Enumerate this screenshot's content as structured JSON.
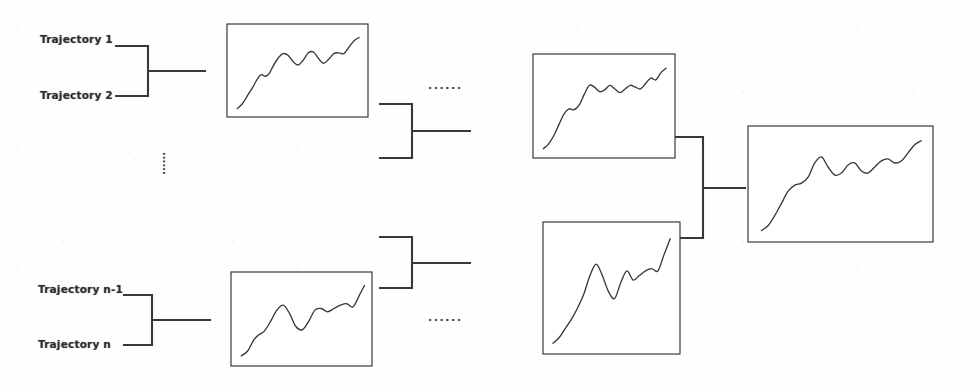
{
  "figure": {
    "background_color": "#fefefe",
    "stroke_color": "#39393b",
    "label_color": "#2e2e30",
    "width": 980,
    "height": 386
  },
  "labels": {
    "trajectory_1": "Trajectory 1",
    "trajectory_2": "Trajectory 2",
    "trajectory_n_minus_1": "Trajectory n-1",
    "trajectory_n": "Trajectory  n"
  },
  "ellipses": {
    "vertical_between_groups": "......",
    "horizontal_top": "......",
    "horizontal_bottom": "......"
  },
  "brackets": [
    {
      "name": "merge-bracket-level1-top",
      "x_left": 120,
      "x_mid": 148,
      "x_right": 205,
      "y_top": 46,
      "y_bottom": 96,
      "y_out": 71
    },
    {
      "name": "merge-bracket-level1-bottom",
      "x_left": 124,
      "x_mid": 152,
      "x_right": 210,
      "y_top": 295,
      "y_bottom": 345,
      "y_out": 320
    },
    {
      "name": "merge-bracket-level2-top",
      "x_left": 380,
      "x_mid": 412,
      "x_right": 470,
      "y_top": 104,
      "y_bottom": 158,
      "y_out": 131
    },
    {
      "name": "merge-bracket-level2-bottom",
      "x_left": 380,
      "x_mid": 412,
      "x_right": 470,
      "y_top": 237,
      "y_bottom": 288,
      "y_out": 263
    },
    {
      "name": "merge-bracket-level3-final",
      "x_left": 672,
      "x_mid": 703,
      "x_right": 745,
      "y_top": 137,
      "y_bottom": 238,
      "y_out": 188
    }
  ],
  "chart_data": [
    {
      "name": "trajectory-chart-group-1",
      "type": "line",
      "title": "",
      "xlabel": "",
      "ylabel": "",
      "grid": false,
      "legend": null,
      "box": {
        "x": 227,
        "y": 24,
        "width": 141,
        "height": 93
      },
      "xlim": [
        0,
        100
      ],
      "ylim": [
        0,
        100
      ],
      "x": [
        2,
        6,
        10,
        14,
        18,
        21,
        24,
        27,
        30,
        34,
        38,
        42,
        46,
        50,
        54,
        58,
        62,
        66,
        70,
        74,
        78,
        82,
        86,
        90,
        94,
        98
      ],
      "y": [
        4,
        10,
        20,
        30,
        41,
        46,
        44,
        47,
        56,
        66,
        72,
        70,
        62,
        58,
        64,
        73,
        74,
        66,
        60,
        65,
        72,
        73,
        72,
        80,
        88,
        92
      ]
    },
    {
      "name": "trajectory-chart-group-n",
      "type": "line",
      "title": "",
      "xlabel": "",
      "ylabel": "",
      "grid": false,
      "legend": null,
      "box": {
        "x": 231,
        "y": 272,
        "width": 141,
        "height": 94
      },
      "xlim": [
        0,
        100
      ],
      "ylim": [
        0,
        100
      ],
      "x": [
        2,
        7,
        12,
        16,
        20,
        25,
        30,
        35,
        40,
        45,
        50,
        55,
        60,
        65,
        70,
        75,
        80,
        85,
        90,
        95,
        99
      ],
      "y": [
        6,
        12,
        26,
        32,
        36,
        48,
        62,
        68,
        58,
        42,
        38,
        48,
        62,
        64,
        60,
        64,
        68,
        70,
        66,
        80,
        92
      ]
    },
    {
      "name": "merged-chart-top",
      "type": "line",
      "title": "",
      "xlabel": "",
      "ylabel": "",
      "grid": false,
      "legend": null,
      "box": {
        "x": 533,
        "y": 54,
        "width": 142,
        "height": 104
      },
      "xlim": [
        0,
        100
      ],
      "ylim": [
        0,
        100
      ],
      "x": [
        2,
        6,
        10,
        14,
        18,
        22,
        26,
        30,
        34,
        38,
        42,
        46,
        50,
        54,
        58,
        62,
        66,
        70,
        74,
        78,
        82,
        86,
        90,
        94,
        98
      ],
      "y": [
        4,
        9,
        18,
        30,
        42,
        48,
        47,
        52,
        64,
        74,
        72,
        67,
        69,
        74,
        70,
        66,
        70,
        74,
        72,
        70,
        76,
        82,
        80,
        88,
        93
      ]
    },
    {
      "name": "merged-chart-bottom",
      "type": "line",
      "title": "",
      "xlabel": "",
      "ylabel": "",
      "grid": false,
      "legend": null,
      "box": {
        "x": 543,
        "y": 222,
        "width": 137,
        "height": 132
      },
      "xlim": [
        0,
        100
      ],
      "ylim": [
        0,
        100
      ],
      "x": [
        2,
        7,
        12,
        17,
        22,
        27,
        32,
        37,
        42,
        47,
        52,
        57,
        62,
        67,
        72,
        77,
        82,
        87,
        92,
        97
      ],
      "y": [
        3,
        8,
        16,
        24,
        34,
        46,
        62,
        72,
        62,
        48,
        42,
        56,
        66,
        58,
        62,
        66,
        68,
        66,
        80,
        94
      ]
    },
    {
      "name": "final-aggregated-chart",
      "type": "line",
      "title": "",
      "xlabel": "",
      "ylabel": "",
      "grid": false,
      "legend": null,
      "box": {
        "x": 748,
        "y": 126,
        "width": 185,
        "height": 116
      },
      "xlim": [
        0,
        100
      ],
      "ylim": [
        0,
        100
      ],
      "x": [
        2,
        6,
        10,
        14,
        18,
        22,
        26,
        30,
        34,
        38,
        42,
        46,
        50,
        54,
        58,
        62,
        66,
        70,
        74,
        78,
        82,
        86,
        90,
        94,
        98
      ],
      "y": [
        5,
        10,
        20,
        32,
        44,
        50,
        52,
        58,
        72,
        78,
        68,
        60,
        62,
        70,
        72,
        64,
        62,
        68,
        74,
        76,
        72,
        74,
        82,
        90,
        94
      ]
    }
  ]
}
